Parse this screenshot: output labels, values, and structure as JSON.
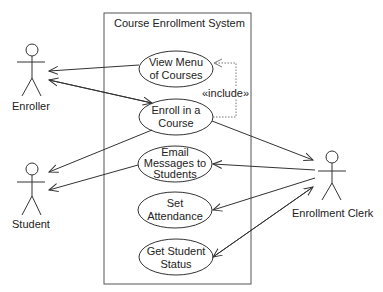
{
  "system": {
    "title": "Course Enrollment System"
  },
  "actors": [
    {
      "id": "enroller",
      "label": "Enroller"
    },
    {
      "id": "student",
      "label": "Student"
    },
    {
      "id": "clerk",
      "label": "Enrollment Clerk"
    }
  ],
  "use_cases": [
    {
      "id": "view_menu",
      "line1": "View Menu",
      "line2": "of Courses",
      "line3": ""
    },
    {
      "id": "enroll",
      "line1": "Enroll in a",
      "line2": "Course",
      "line3": ""
    },
    {
      "id": "email",
      "line1": "Email",
      "line2": "Messages to",
      "line3": "Students"
    },
    {
      "id": "attendance",
      "line1": "Set",
      "line2": "Attendance",
      "line3": ""
    },
    {
      "id": "status",
      "line1": "Get Student",
      "line2": "Status",
      "line3": ""
    }
  ],
  "relations": {
    "include_label": "«include»"
  },
  "colors": {
    "line": "#333333",
    "dotted": "#777777",
    "box": "#555555"
  }
}
